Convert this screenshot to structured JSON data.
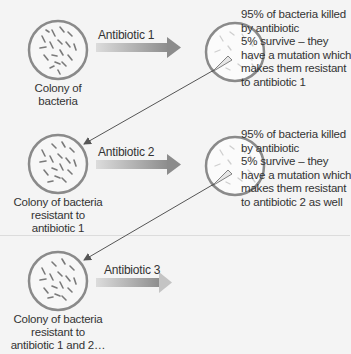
{
  "diagram": {
    "colonies": [
      {
        "label_lines": [
          "Colony of",
          "bacteria"
        ]
      },
      {
        "label_lines": [
          "Colony of bacteria",
          "resistant to",
          "antibiotic 1"
        ]
      },
      {
        "label_lines": [
          "Colony of bacteria",
          "resistant to",
          "antibiotic 1 and 2…"
        ]
      }
    ],
    "arrows": [
      {
        "label": "Antibiotic 1"
      },
      {
        "label": "Antibiotic 2"
      },
      {
        "label": "Antibiotic 3"
      }
    ],
    "outcomes": [
      {
        "lines": [
          "95% of bacteria killed",
          "by antibiotic",
          "5% survive – they",
          "have a mutation which",
          "makes them resistant",
          "to antibiotic 1"
        ]
      },
      {
        "lines": [
          "95% of bacteria killed",
          "by antibiotic",
          "5% survive – they",
          "have a mutation which",
          "makes them resistant",
          "to antibiotic 2 as well"
        ]
      }
    ],
    "colors": {
      "background": "#f4f4f4",
      "circle_stroke": "#8a8a8a",
      "bacteria": "#7a7a7a",
      "arrow_light": "#d8d8d8",
      "arrow_dark": "#8f8f8f",
      "connector": "#555555"
    }
  }
}
